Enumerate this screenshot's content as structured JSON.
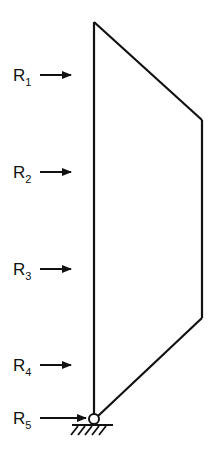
{
  "diagram": {
    "type": "structural-frame",
    "colors": {
      "stroke": "#111111",
      "background": "#ffffff"
    },
    "loads": [
      {
        "label": "R",
        "subscript": "1",
        "y": 75
      },
      {
        "label": "R",
        "subscript": "2",
        "y": 172
      },
      {
        "label": "R",
        "subscript": "3",
        "y": 269
      },
      {
        "label": "R",
        "subscript": "4",
        "y": 365
      },
      {
        "label": "R",
        "subscript": "5",
        "y": 418
      }
    ],
    "support": {
      "type": "pinned",
      "label": "pin-support"
    }
  }
}
